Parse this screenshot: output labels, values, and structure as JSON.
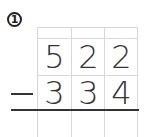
{
  "problem": {
    "number_label": "1",
    "operator": "-",
    "minuend_digits": [
      "5",
      "2",
      "2"
    ],
    "subtrahend_digits": [
      "3",
      "3",
      "4"
    ],
    "answer_digits": [
      "",
      "",
      ""
    ]
  }
}
